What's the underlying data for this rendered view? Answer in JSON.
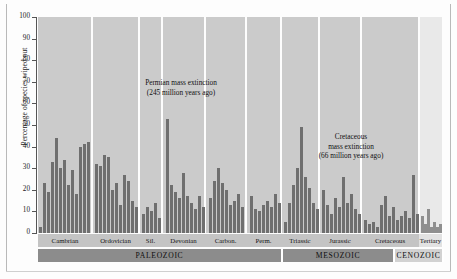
{
  "chart_data": {
    "type": "bar",
    "title": "",
    "xlabel": "",
    "ylabel": "Percentage of species wiped out",
    "ylim": [
      0,
      100
    ],
    "yticks": [
      0,
      10,
      20,
      30,
      40,
      50,
      60,
      70,
      80,
      90,
      100
    ],
    "grid": false,
    "legend": false,
    "annotations": [
      {
        "id": "permian",
        "line1": "Permian mass extinction",
        "line2": "(245 million years ago)"
      },
      {
        "id": "cretaceous",
        "line1": "Cretaceous",
        "line2": "mass extinction",
        "line3": "(66 million years ago)"
      }
    ],
    "eras": [
      {
        "label": "PALEOZOIC",
        "start": 0,
        "end": 243,
        "light": false
      },
      {
        "label": "MESOZOIC",
        "start": 245,
        "end": 355,
        "light": false
      },
      {
        "label": "CENOZOIC",
        "start": 357,
        "end": 404,
        "light": true
      }
    ],
    "periods": [
      {
        "label": "Cambrian",
        "start": 0,
        "end": 54,
        "light": false
      },
      {
        "label": "Ordovician",
        "start": 54,
        "end": 101,
        "light": false
      },
      {
        "label": "Sil.",
        "start": 101,
        "end": 124,
        "light": false
      },
      {
        "label": "Devonian",
        "start": 124,
        "end": 167,
        "light": false
      },
      {
        "label": "Carbon.",
        "start": 167,
        "end": 208,
        "light": false
      },
      {
        "label": "Perm.",
        "start": 208,
        "end": 243,
        "light": false
      },
      {
        "label": "Triassic",
        "start": 243,
        "end": 281,
        "light": false
      },
      {
        "label": "Jurassic",
        "start": 281,
        "end": 323,
        "light": false
      },
      {
        "label": "Cretaceous",
        "start": 323,
        "end": 381,
        "light": false
      },
      {
        "label": "Tertiary",
        "start": 381,
        "end": 404,
        "light": true
      }
    ],
    "panels": [
      {
        "start": 0,
        "end": 53,
        "light": false
      },
      {
        "start": 55,
        "end": 100,
        "light": false
      },
      {
        "start": 102,
        "end": 123,
        "light": false
      },
      {
        "start": 125,
        "end": 166,
        "light": false
      },
      {
        "start": 168,
        "end": 207,
        "light": false
      },
      {
        "start": 209,
        "end": 242,
        "light": false
      },
      {
        "start": 244,
        "end": 280,
        "light": false
      },
      {
        "start": 282,
        "end": 322,
        "light": false
      },
      {
        "start": 324,
        "end": 380,
        "light": false
      },
      {
        "start": 382,
        "end": 404,
        "light": true
      }
    ],
    "bar_width": 2.6,
    "bars": [
      {
        "x": 1,
        "v": 3,
        "period": "Cambrian"
      },
      {
        "x": 5,
        "v": 23,
        "period": "Cambrian"
      },
      {
        "x": 9,
        "v": 19,
        "period": "Cambrian"
      },
      {
        "x": 13,
        "v": 33,
        "period": "Cambrian"
      },
      {
        "x": 17,
        "v": 44,
        "period": "Cambrian"
      },
      {
        "x": 21,
        "v": 30,
        "period": "Cambrian"
      },
      {
        "x": 25,
        "v": 34,
        "period": "Cambrian"
      },
      {
        "x": 29,
        "v": 22,
        "period": "Cambrian"
      },
      {
        "x": 33,
        "v": 29,
        "period": "Cambrian"
      },
      {
        "x": 37,
        "v": 18,
        "period": "Cambrian"
      },
      {
        "x": 41,
        "v": 40,
        "period": "Cambrian"
      },
      {
        "x": 45,
        "v": 41,
        "period": "Cambrian"
      },
      {
        "x": 49,
        "v": 42,
        "period": "Cambrian"
      },
      {
        "x": 57,
        "v": 32,
        "period": "Ordovician"
      },
      {
        "x": 61,
        "v": 31,
        "period": "Ordovician"
      },
      {
        "x": 65,
        "v": 36,
        "period": "Ordovician"
      },
      {
        "x": 69,
        "v": 35,
        "period": "Ordovician"
      },
      {
        "x": 73,
        "v": 20,
        "period": "Ordovician"
      },
      {
        "x": 77,
        "v": 23,
        "period": "Ordovician"
      },
      {
        "x": 81,
        "v": 13,
        "period": "Ordovician"
      },
      {
        "x": 85,
        "v": 27,
        "period": "Ordovician"
      },
      {
        "x": 89,
        "v": 24,
        "period": "Ordovician"
      },
      {
        "x": 93,
        "v": 15,
        "period": "Ordovician"
      },
      {
        "x": 97,
        "v": 12,
        "period": "Ordovician"
      },
      {
        "x": 104,
        "v": 9,
        "period": "Sil."
      },
      {
        "x": 108,
        "v": 12,
        "period": "Sil."
      },
      {
        "x": 112,
        "v": 10,
        "period": "Sil."
      },
      {
        "x": 116,
        "v": 14,
        "period": "Sil."
      },
      {
        "x": 120,
        "v": 7,
        "period": "Sil."
      },
      {
        "x": 128,
        "v": 53,
        "period": "Devonian"
      },
      {
        "x": 132,
        "v": 22,
        "period": "Devonian"
      },
      {
        "x": 136,
        "v": 19,
        "period": "Devonian"
      },
      {
        "x": 140,
        "v": 16,
        "period": "Devonian"
      },
      {
        "x": 144,
        "v": 28,
        "period": "Devonian"
      },
      {
        "x": 148,
        "v": 17,
        "period": "Devonian"
      },
      {
        "x": 152,
        "v": 14,
        "period": "Devonian"
      },
      {
        "x": 156,
        "v": 11,
        "period": "Devonian"
      },
      {
        "x": 160,
        "v": 17,
        "period": "Devonian"
      },
      {
        "x": 164,
        "v": 12,
        "period": "Devonian"
      },
      {
        "x": 171,
        "v": 16,
        "period": "Carbon."
      },
      {
        "x": 175,
        "v": 24,
        "period": "Carbon."
      },
      {
        "x": 179,
        "v": 30,
        "period": "Carbon."
      },
      {
        "x": 183,
        "v": 23,
        "period": "Carbon."
      },
      {
        "x": 187,
        "v": 20,
        "period": "Carbon."
      },
      {
        "x": 191,
        "v": 13,
        "period": "Carbon."
      },
      {
        "x": 195,
        "v": 15,
        "period": "Carbon."
      },
      {
        "x": 199,
        "v": 18,
        "period": "Carbon."
      },
      {
        "x": 203,
        "v": 12,
        "period": "Carbon."
      },
      {
        "x": 212,
        "v": 17,
        "period": "Perm."
      },
      {
        "x": 216,
        "v": 11,
        "period": "Perm."
      },
      {
        "x": 220,
        "v": 10,
        "period": "Perm."
      },
      {
        "x": 224,
        "v": 13,
        "period": "Perm."
      },
      {
        "x": 228,
        "v": 15,
        "period": "Perm."
      },
      {
        "x": 232,
        "v": 12,
        "period": "Perm."
      },
      {
        "x": 236,
        "v": 18,
        "period": "Perm."
      },
      {
        "x": 240,
        "v": 14,
        "period": "Perm."
      },
      {
        "x": 246,
        "v": 5,
        "period": "Triassic"
      },
      {
        "x": 250,
        "v": 14,
        "period": "Triassic"
      },
      {
        "x": 254,
        "v": 22,
        "period": "Triassic"
      },
      {
        "x": 258,
        "v": 30,
        "period": "Triassic"
      },
      {
        "x": 262,
        "v": 49,
        "period": "Triassic"
      },
      {
        "x": 266,
        "v": 26,
        "period": "Triassic"
      },
      {
        "x": 270,
        "v": 21,
        "period": "Triassic"
      },
      {
        "x": 274,
        "v": 14,
        "period": "Triassic"
      },
      {
        "x": 278,
        "v": 11,
        "period": "Triassic"
      },
      {
        "x": 284,
        "v": 20,
        "period": "Jurassic"
      },
      {
        "x": 288,
        "v": 13,
        "period": "Jurassic"
      },
      {
        "x": 292,
        "v": 9,
        "period": "Jurassic"
      },
      {
        "x": 296,
        "v": 16,
        "period": "Jurassic"
      },
      {
        "x": 300,
        "v": 12,
        "period": "Jurassic"
      },
      {
        "x": 304,
        "v": 26,
        "period": "Jurassic"
      },
      {
        "x": 308,
        "v": 14,
        "period": "Jurassic"
      },
      {
        "x": 312,
        "v": 18,
        "period": "Jurassic"
      },
      {
        "x": 316,
        "v": 11,
        "period": "Jurassic"
      },
      {
        "x": 320,
        "v": 9,
        "period": "Jurassic"
      },
      {
        "x": 326,
        "v": 6,
        "period": "Cretaceous"
      },
      {
        "x": 330,
        "v": 4,
        "period": "Cretaceous"
      },
      {
        "x": 334,
        "v": 5,
        "period": "Cretaceous"
      },
      {
        "x": 338,
        "v": 3,
        "period": "Cretaceous"
      },
      {
        "x": 342,
        "v": 13,
        "period": "Cretaceous"
      },
      {
        "x": 346,
        "v": 17,
        "period": "Cretaceous"
      },
      {
        "x": 350,
        "v": 8,
        "period": "Cretaceous"
      },
      {
        "x": 354,
        "v": 12,
        "period": "Cretaceous"
      },
      {
        "x": 358,
        "v": 6,
        "period": "Cretaceous"
      },
      {
        "x": 362,
        "v": 8,
        "period": "Cretaceous"
      },
      {
        "x": 366,
        "v": 10,
        "period": "Cretaceous"
      },
      {
        "x": 370,
        "v": 7,
        "period": "Cretaceous"
      },
      {
        "x": 374,
        "v": 27,
        "period": "Cretaceous"
      },
      {
        "x": 378,
        "v": 9,
        "period": "Cretaceous"
      },
      {
        "x": 383,
        "v": 8,
        "period": "Tertiary"
      },
      {
        "x": 386,
        "v": 4,
        "period": "Tertiary"
      },
      {
        "x": 389,
        "v": 11,
        "period": "Tertiary"
      },
      {
        "x": 392,
        "v": 3,
        "period": "Tertiary"
      },
      {
        "x": 395,
        "v": 5,
        "period": "Tertiary"
      },
      {
        "x": 398,
        "v": 3,
        "period": "Tertiary"
      },
      {
        "x": 401,
        "v": 4,
        "period": "Tertiary"
      }
    ]
  }
}
